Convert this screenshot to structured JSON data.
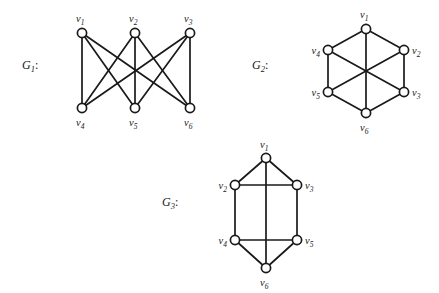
{
  "figure": {
    "background_color": "#ffffff",
    "stroke_color": "#1a1a1a",
    "vertex_fill": "#ffffff",
    "vertex_radius": 4.6,
    "canvas": {
      "width": 439,
      "height": 293
    }
  },
  "graphs": [
    {
      "id": "G1",
      "title_letter": "G",
      "title_sub": "1",
      "title_colon": ":",
      "title_pos": {
        "x": 22,
        "y": 69
      },
      "description": "complete bipartite graph K3,3",
      "vertices": [
        {
          "id": "v1",
          "letter": "v",
          "sub": "1",
          "x": 82,
          "y": 33,
          "label_x": 76,
          "label_y": 22,
          "label_anchor": "start"
        },
        {
          "id": "v2",
          "letter": "v",
          "sub": "2",
          "x": 135,
          "y": 33,
          "label_x": 129,
          "label_y": 22,
          "label_anchor": "start"
        },
        {
          "id": "v3",
          "letter": "v",
          "sub": "3",
          "x": 190,
          "y": 33,
          "label_x": 184,
          "label_y": 22,
          "label_anchor": "start"
        },
        {
          "id": "v4",
          "letter": "v",
          "sub": "4",
          "x": 82,
          "y": 108,
          "label_x": 76,
          "label_y": 126,
          "label_anchor": "start"
        },
        {
          "id": "v5",
          "letter": "v",
          "sub": "5",
          "x": 135,
          "y": 108,
          "label_x": 129,
          "label_y": 126,
          "label_anchor": "start"
        },
        {
          "id": "v6",
          "letter": "v",
          "sub": "6",
          "x": 190,
          "y": 108,
          "label_x": 184,
          "label_y": 126,
          "label_anchor": "start"
        }
      ],
      "edges": [
        {
          "from": "v1",
          "to": "v4"
        },
        {
          "from": "v1",
          "to": "v5"
        },
        {
          "from": "v1",
          "to": "v6"
        },
        {
          "from": "v2",
          "to": "v4"
        },
        {
          "from": "v2",
          "to": "v5"
        },
        {
          "from": "v2",
          "to": "v6"
        },
        {
          "from": "v3",
          "to": "v4"
        },
        {
          "from": "v3",
          "to": "v5"
        },
        {
          "from": "v3",
          "to": "v6"
        }
      ]
    },
    {
      "id": "G2",
      "title_letter": "G",
      "title_sub": "2",
      "title_colon": ":",
      "title_pos": {
        "x": 252,
        "y": 69
      },
      "description": "hexagon with three main diagonals",
      "vertices": [
        {
          "id": "v1",
          "letter": "v",
          "sub": "1",
          "x": 366,
          "y": 29,
          "label_x": 360,
          "label_y": 18,
          "label_anchor": "start"
        },
        {
          "id": "v2",
          "letter": "v",
          "sub": "2",
          "x": 404,
          "y": 50,
          "label_x": 412,
          "label_y": 54,
          "label_anchor": "start"
        },
        {
          "id": "v3",
          "letter": "v",
          "sub": "3",
          "x": 404,
          "y": 92,
          "label_x": 412,
          "label_y": 96,
          "label_anchor": "start"
        },
        {
          "id": "v4",
          "letter": "v",
          "sub": "4",
          "x": 328,
          "y": 50,
          "label_x": 320,
          "label_y": 54,
          "label_anchor": "end"
        },
        {
          "id": "v5",
          "letter": "v",
          "sub": "5",
          "x": 328,
          "y": 92,
          "label_x": 320,
          "label_y": 96,
          "label_anchor": "end"
        },
        {
          "id": "v6",
          "letter": "v",
          "sub": "6",
          "x": 366,
          "y": 113,
          "label_x": 360,
          "label_y": 131,
          "label_anchor": "start"
        }
      ],
      "edges": [
        {
          "from": "v1",
          "to": "v2"
        },
        {
          "from": "v2",
          "to": "v3"
        },
        {
          "from": "v3",
          "to": "v6"
        },
        {
          "from": "v6",
          "to": "v5"
        },
        {
          "from": "v5",
          "to": "v4"
        },
        {
          "from": "v4",
          "to": "v1"
        },
        {
          "from": "v1",
          "to": "v6"
        },
        {
          "from": "v4",
          "to": "v3"
        },
        {
          "from": "v2",
          "to": "v5"
        }
      ]
    },
    {
      "id": "G3",
      "title_letter": "G",
      "title_sub": "3",
      "title_colon": ":",
      "title_pos": {
        "x": 162,
        "y": 206
      },
      "description": "elongated hexagon with rungs and central vertical edge",
      "vertices": [
        {
          "id": "v1",
          "letter": "v",
          "sub": "1",
          "x": 266,
          "y": 158,
          "label_x": 260,
          "label_y": 148,
          "label_anchor": "start"
        },
        {
          "id": "v2",
          "letter": "v",
          "sub": "2",
          "x": 235,
          "y": 185,
          "label_x": 227,
          "label_y": 189,
          "label_anchor": "end"
        },
        {
          "id": "v3",
          "letter": "v",
          "sub": "3",
          "x": 297,
          "y": 185,
          "label_x": 305,
          "label_y": 189,
          "label_anchor": "start"
        },
        {
          "id": "v4",
          "letter": "v",
          "sub": "4",
          "x": 235,
          "y": 240,
          "label_x": 227,
          "label_y": 244,
          "label_anchor": "end"
        },
        {
          "id": "v5",
          "letter": "v",
          "sub": "5",
          "x": 297,
          "y": 240,
          "label_x": 305,
          "label_y": 244,
          "label_anchor": "start"
        },
        {
          "id": "v6",
          "letter": "v",
          "sub": "6",
          "x": 266,
          "y": 268,
          "label_x": 260,
          "label_y": 286,
          "label_anchor": "start"
        }
      ],
      "edges": [
        {
          "from": "v1",
          "to": "v2"
        },
        {
          "from": "v1",
          "to": "v3"
        },
        {
          "from": "v2",
          "to": "v3"
        },
        {
          "from": "v2",
          "to": "v4"
        },
        {
          "from": "v3",
          "to": "v5"
        },
        {
          "from": "v4",
          "to": "v5"
        },
        {
          "from": "v4",
          "to": "v6"
        },
        {
          "from": "v5",
          "to": "v6"
        },
        {
          "from": "v1",
          "to": "v6"
        }
      ]
    }
  ]
}
